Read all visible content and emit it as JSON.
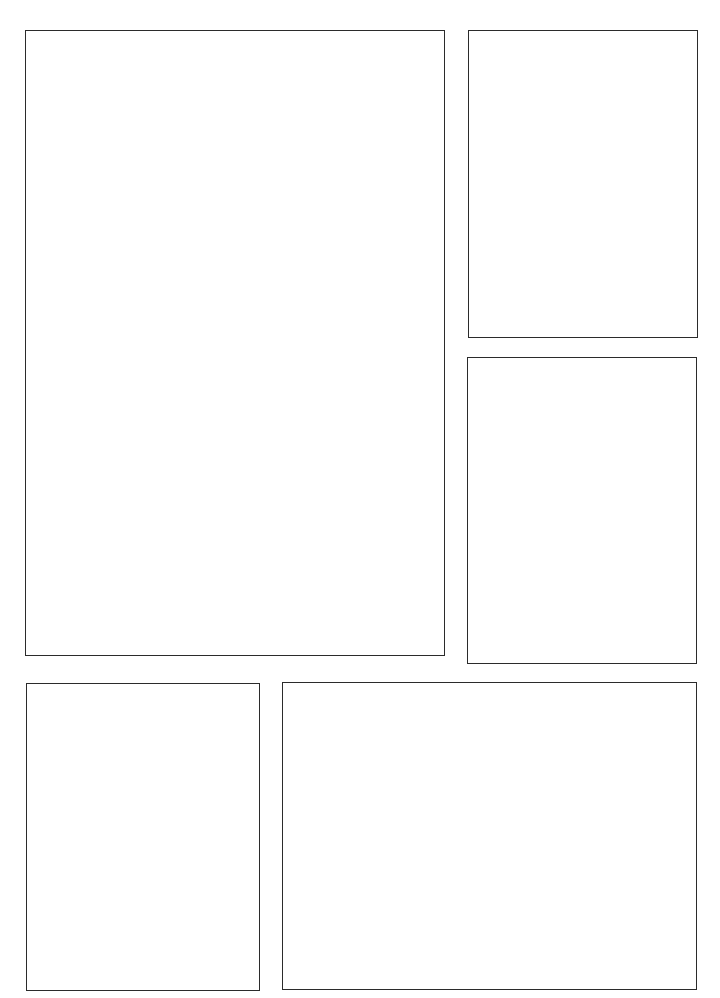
{
  "page": {
    "type": "comic-page-template",
    "panel_count": 5,
    "border_color": "#2b2b2b",
    "background_color": "#ffffff",
    "panels": [
      {
        "id": 1,
        "name": "large-top-left",
        "content": ""
      },
      {
        "id": 2,
        "name": "top-right",
        "content": ""
      },
      {
        "id": 3,
        "name": "middle-right",
        "content": ""
      },
      {
        "id": 4,
        "name": "bottom-left",
        "content": ""
      },
      {
        "id": 5,
        "name": "bottom-right-wide",
        "content": ""
      }
    ]
  }
}
